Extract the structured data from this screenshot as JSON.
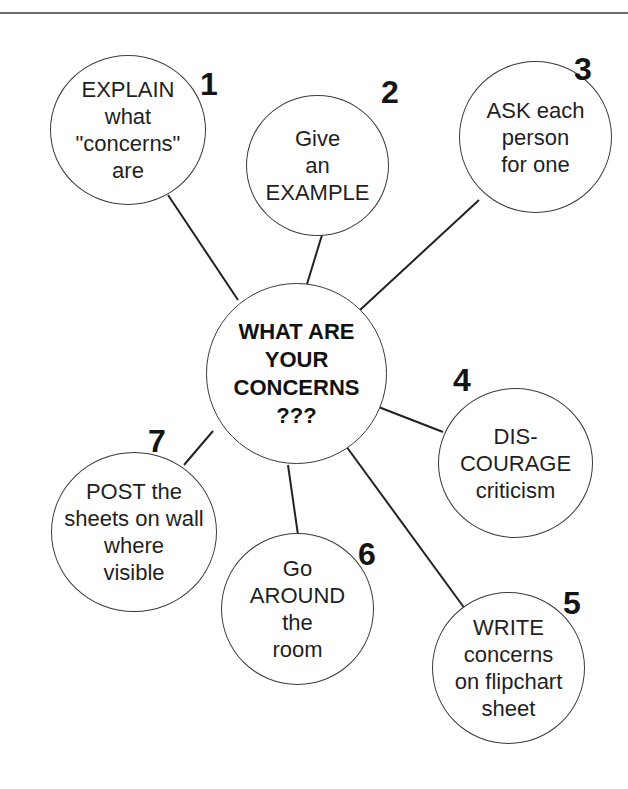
{
  "diagram": {
    "type": "mind-map",
    "center": {
      "label": "WHAT ARE\nYOUR\nCONCERNS\n???"
    },
    "nodes": [
      {
        "number": "1",
        "label": "EXPLAIN\nwhat\n\"concerns\"\nare"
      },
      {
        "number": "2",
        "label": "Give\nan\nEXAMPLE"
      },
      {
        "number": "3",
        "label": "ASK each\nperson\nfor one"
      },
      {
        "number": "4",
        "label": "DIS-\nCOURAGE\ncriticism"
      },
      {
        "number": "5",
        "label": "WRITE\nconcerns\non flipchart\nsheet"
      },
      {
        "number": "6",
        "label": "Go\nAROUND\nthe\nroom"
      },
      {
        "number": "7",
        "label": "POST the\nsheets on wall\nwhere\nvisible"
      }
    ]
  },
  "colors": {
    "stroke": "#3a3a3a",
    "text": "#1f1f1f",
    "rule": "#6e6e6e",
    "background": "#ffffff"
  }
}
